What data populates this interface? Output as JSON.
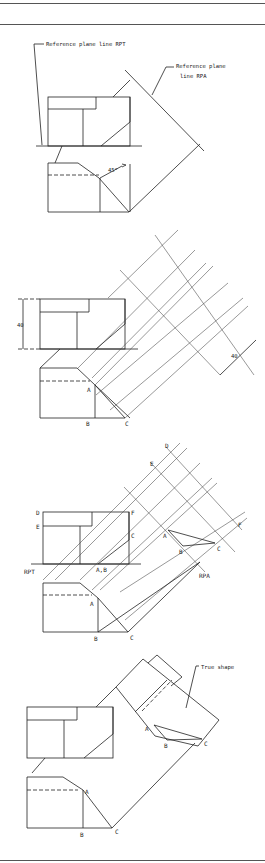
{
  "figure": {
    "panels": [
      {
        "id": "panel-1",
        "labels": {
          "rpt": "Reference plane line RPT",
          "rpa_line1": "Reference plane",
          "rpa_line2": "line RPA",
          "angle": "45°"
        }
      },
      {
        "id": "panel-2",
        "labels": {
          "height_dim": "40",
          "depth_dim": "40",
          "pt_a": "A",
          "pt_b": "B",
          "pt_c": "C"
        }
      },
      {
        "id": "panel-3",
        "labels": {
          "pt_d_top": "D",
          "pt_e_top": "E",
          "pt_f_top": "F",
          "pt_c_top": "C",
          "pt_ab_top": "A,B",
          "rpt": "RPT",
          "pt_d_aux": "D",
          "pt_e_aux": "E",
          "pt_f_aux": "F",
          "pt_a_aux": "A",
          "pt_b_aux": "B",
          "pt_c_aux": "C",
          "rpa": "RPA",
          "pt_a": "A",
          "pt_b": "B",
          "pt_c": "C"
        }
      },
      {
        "id": "panel-4",
        "labels": {
          "true_shape": "True shape",
          "pt_a_aux": "A",
          "pt_b_aux": "B",
          "pt_c_aux": "C",
          "pt_a": "A",
          "pt_b": "B",
          "pt_c": "C"
        }
      }
    ]
  }
}
